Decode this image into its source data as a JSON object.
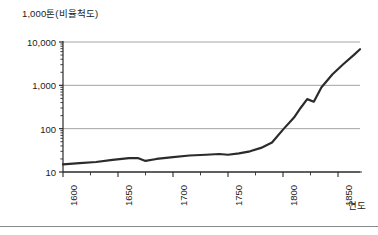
{
  "chart_data": {
    "type": "line",
    "title": "1,000톤(비율척도)",
    "xlabel": "연도",
    "ylabel": "1,000톤(비율척도)",
    "yscale": "log",
    "ylim": [
      10,
      10000
    ],
    "xlim": [
      1600,
      1870
    ],
    "grid": true,
    "legend": "none",
    "ytick_labels": [
      "10,000",
      "1,000",
      "100",
      "10"
    ],
    "ytick_values": [
      10000,
      1000,
      100,
      10
    ],
    "xtick_labels": [
      "1600",
      "1650",
      "1700",
      "1750",
      "1800",
      "1850"
    ],
    "xtick_values": [
      1600,
      1650,
      1700,
      1750,
      1800,
      1850
    ],
    "x_minor_step": 25,
    "series": [
      {
        "name": "석탄 생산량",
        "x": [
          1600,
          1615,
          1630,
          1645,
          1660,
          1668,
          1675,
          1685,
          1700,
          1715,
          1730,
          1742,
          1750,
          1760,
          1770,
          1780,
          1790,
          1800,
          1810,
          1816,
          1822,
          1828,
          1835,
          1845,
          1855,
          1865,
          1870
        ],
        "values": [
          15,
          16,
          17,
          19,
          21,
          21,
          18,
          20,
          22,
          24,
          25,
          26,
          25,
          27,
          30,
          36,
          48,
          95,
          180,
          300,
          480,
          420,
          900,
          1800,
          3100,
          5200,
          6800
        ]
      }
    ]
  },
  "figure": {
    "plot_left": 63,
    "plot_right": 360,
    "plot_top": 42,
    "plot_bottom": 172
  }
}
